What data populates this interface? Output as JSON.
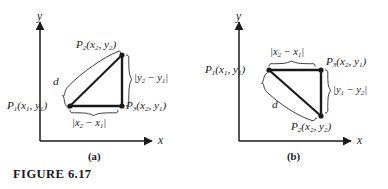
{
  "figure": {
    "caption": "FIGURE 6.17",
    "panel_a_caption": "(a)",
    "panel_b_caption": "(b)",
    "line_color": "#1a1a1a",
    "background": "#ffffff"
  },
  "panel_a": {
    "axis_x_label": "x",
    "axis_y_label": "y",
    "points": [
      {
        "name": "P",
        "index": "1",
        "coords": "(x1, y1)",
        "position": "bottom-left"
      },
      {
        "name": "P",
        "index": "2",
        "coords": "(x2, y2)",
        "position": "top-right"
      },
      {
        "name": "P",
        "index": "3",
        "coords": "(x2, y1)",
        "position": "bottom-right"
      }
    ],
    "label_p1_name": "P",
    "label_p1_sub": "1",
    "label_p1_args": "(x",
    "hypotenuse_label": "d",
    "vertical_dim_label": "|y2 − y1|",
    "horizontal_dim_label": "|x2 − x1|"
  },
  "panel_b": {
    "axis_x_label": "x",
    "axis_y_label": "y",
    "points": [
      {
        "name": "P",
        "index": "1",
        "coords": "(x1, y1)",
        "position": "top-left"
      },
      {
        "name": "P",
        "index": "2",
        "coords": "(x2, y2)",
        "position": "bottom-right"
      },
      {
        "name": "P",
        "index": "3",
        "coords": "(x2, y1)",
        "position": "top-right"
      }
    ],
    "hypotenuse_label": "d",
    "vertical_dim_label": "|y1 − y2|",
    "horizontal_dim_label": "|x2 − x1|"
  }
}
